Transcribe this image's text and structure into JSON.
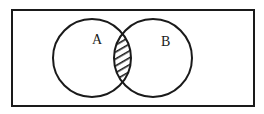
{
  "diagram": {
    "type": "venn",
    "sets": [
      {
        "label": "A"
      },
      {
        "label": "B"
      }
    ],
    "shaded_region": "A ∩ B",
    "colors": {
      "stroke": "#1a1a1a",
      "background": "#ffffff"
    }
  }
}
